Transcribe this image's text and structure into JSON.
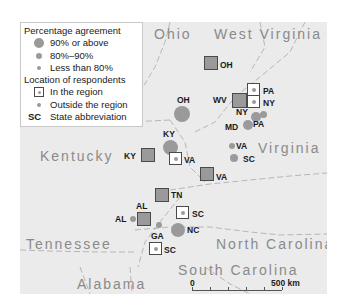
{
  "legend": {
    "agreement_title": "Percentage agreement",
    "agreement_items": [
      {
        "label": "90% or above",
        "size": "large"
      },
      {
        "label": "80%–90%",
        "size": "medium"
      },
      {
        "label": "Less than 80%",
        "size": "small"
      }
    ],
    "location_title": "Location of respondents",
    "location_items": [
      {
        "label": "In the region",
        "symbol": "square"
      },
      {
        "label": "Outside the region",
        "symbol": "dot"
      }
    ],
    "abbr_key": "SC",
    "abbr_label": "State abbreviation"
  },
  "states": {
    "ohio": "Ohio",
    "west_virginia": "West Virginia",
    "kentucky": "Kentucky",
    "virginia": "Virginia",
    "tennessee": "Tennessee",
    "north_carolina": "North Carolina",
    "south_carolina": "South Carolina",
    "alabama": "Alabama"
  },
  "markers": [
    {
      "abbr": "OH",
      "type": "square-filled",
      "agreement": "90% or above"
    },
    {
      "abbr": "PA",
      "type": "square-hollow",
      "agreement": "n/a"
    },
    {
      "abbr": "NY",
      "type": "square-hollow",
      "agreement": "n/a"
    },
    {
      "abbr": "WV",
      "type": "square-filled",
      "agreement": "90% or above"
    },
    {
      "abbr": "OH",
      "type": "dot",
      "agreement": "90% or above"
    },
    {
      "abbr": "NY",
      "type": "dot",
      "agreement": "80%–90%"
    },
    {
      "abbr": "PA",
      "type": "dot",
      "agreement": "80%–90%"
    },
    {
      "abbr": "MD",
      "type": "dot",
      "agreement": "80%–90%"
    },
    {
      "abbr": "KY",
      "type": "dot",
      "agreement": "90% or above"
    },
    {
      "abbr": "KY",
      "type": "square-filled",
      "agreement": "90% or above"
    },
    {
      "abbr": "VA",
      "type": "square-hollow",
      "agreement": "n/a"
    },
    {
      "abbr": "VA",
      "type": "dot",
      "agreement": "Less than 80%"
    },
    {
      "abbr": "SC",
      "type": "dot",
      "agreement": "80%–90%"
    },
    {
      "abbr": "VA",
      "type": "square-filled",
      "agreement": "90% or above"
    },
    {
      "abbr": "TN",
      "type": "square-filled",
      "agreement": "90% or above"
    },
    {
      "abbr": "SC",
      "type": "square-hollow",
      "agreement": "n/a"
    },
    {
      "abbr": "AL",
      "type": "square-filled",
      "agreement": "90% or above"
    },
    {
      "abbr": "AL",
      "type": "dot",
      "agreement": "Less than 80%"
    },
    {
      "abbr": "GA",
      "type": "dot",
      "agreement": "Less than 80%"
    },
    {
      "abbr": "NC",
      "type": "dot",
      "agreement": "90% or above"
    },
    {
      "abbr": "SC",
      "type": "square-hollow",
      "agreement": "n/a"
    }
  ],
  "scale": {
    "start": "0",
    "end": "500 km"
  },
  "colors": {
    "map_bg": "#ebebeb",
    "symbol_fill": "#9a9a9a",
    "square_border": "#4a4a4a",
    "state_label": "#8a8a8a"
  }
}
